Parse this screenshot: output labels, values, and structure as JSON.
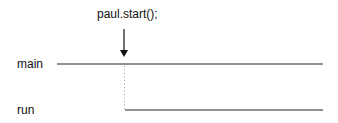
{
  "diagram": {
    "call_label": "paul.start();",
    "threads": [
      {
        "name": "main"
      },
      {
        "name": "run"
      }
    ],
    "colors": {
      "line": "#222222",
      "dotted": "#999999",
      "text": "#111111"
    }
  }
}
